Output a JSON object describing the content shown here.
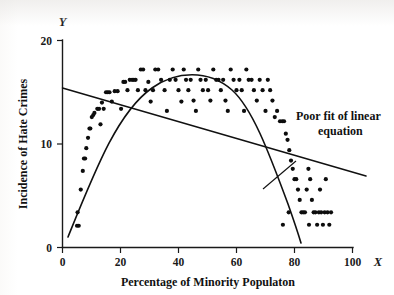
{
  "figure": {
    "background_color": "#ffffff",
    "ink_color": "#111111"
  },
  "chart_data": {
    "type": "scatter",
    "title": "",
    "xlabel": "Percentage of Minority Populaton",
    "ylabel": "Incidence of Hate Crimes",
    "x_axis_letter": "X",
    "y_axis_letter": "Y",
    "xlim": [
      0,
      100
    ],
    "ylim": [
      0,
      20
    ],
    "grid": false,
    "legend": null,
    "xticks": [
      0,
      20,
      40,
      60,
      80,
      100
    ],
    "xtick_labels": [
      "0",
      "20",
      "40",
      "60",
      "80",
      "100"
    ],
    "yticks": [
      0,
      10,
      20
    ],
    "ytick_labels": [
      "0",
      "10",
      "20"
    ],
    "points": [
      [
        5.0,
        2.1
      ],
      [
        5.6,
        2.1
      ],
      [
        5.2,
        3.4
      ],
      [
        6.3,
        5.6
      ],
      [
        7.0,
        7.4
      ],
      [
        7.4,
        8.6
      ],
      [
        7.8,
        8.6
      ],
      [
        8.2,
        9.6
      ],
      [
        8.8,
        10.6
      ],
      [
        9.3,
        11.5
      ],
      [
        9.6,
        11.5
      ],
      [
        10.1,
        12.6
      ],
      [
        10.6,
        12.8
      ],
      [
        11.0,
        13.0
      ],
      [
        12.0,
        13.4
      ],
      [
        12.6,
        13.4
      ],
      [
        13.1,
        11.9
      ],
      [
        13.6,
        14.0
      ],
      [
        14.2,
        13.4
      ],
      [
        15.0,
        15.0
      ],
      [
        15.6,
        15.0
      ],
      [
        16.2,
        15.0
      ],
      [
        17.0,
        14.1
      ],
      [
        18.0,
        15.1
      ],
      [
        19.0,
        15.1
      ],
      [
        20.2,
        13.4
      ],
      [
        21.0,
        16.0
      ],
      [
        21.6,
        16.0
      ],
      [
        22.4,
        15.2
      ],
      [
        23.2,
        16.2
      ],
      [
        24.0,
        16.2
      ],
      [
        24.6,
        16.2
      ],
      [
        25.2,
        16.2
      ],
      [
        26.0,
        15.2
      ],
      [
        27.0,
        17.2
      ],
      [
        27.8,
        17.2
      ],
      [
        28.6,
        15.2
      ],
      [
        29.6,
        16.0
      ],
      [
        30.4,
        14.1
      ],
      [
        31.2,
        15.2
      ],
      [
        32.0,
        17.2
      ],
      [
        33.0,
        17.2
      ],
      [
        34.0,
        16.2
      ],
      [
        35.2,
        15.2
      ],
      [
        36.0,
        13.2
      ],
      [
        37.0,
        16.2
      ],
      [
        38.0,
        17.2
      ],
      [
        39.0,
        16.2
      ],
      [
        40.0,
        15.2
      ],
      [
        41.0,
        14.1
      ],
      [
        41.8,
        17.2
      ],
      [
        42.6,
        16.2
      ],
      [
        43.4,
        15.2
      ],
      [
        44.2,
        16.2
      ],
      [
        45.2,
        14.2
      ],
      [
        46.0,
        13.2
      ],
      [
        46.8,
        17.2
      ],
      [
        47.6,
        16.2
      ],
      [
        48.4,
        15.2
      ],
      [
        49.4,
        16.2
      ],
      [
        50.2,
        15.2
      ],
      [
        51.0,
        14.2
      ],
      [
        52.0,
        17.2
      ],
      [
        53.0,
        16.2
      ],
      [
        53.8,
        16.2
      ],
      [
        54.6,
        15.2
      ],
      [
        55.4,
        16.2
      ],
      [
        56.2,
        14.2
      ],
      [
        57.0,
        13.2
      ],
      [
        58.0,
        17.2
      ],
      [
        59.0,
        16.2
      ],
      [
        60.0,
        15.2
      ],
      [
        61.0,
        16.2
      ],
      [
        61.8,
        15.2
      ],
      [
        62.6,
        13.2
      ],
      [
        63.4,
        17.2
      ],
      [
        64.2,
        16.2
      ],
      [
        65.2,
        16.2
      ],
      [
        66.0,
        15.2
      ],
      [
        67.0,
        14.2
      ],
      [
        68.0,
        16.2
      ],
      [
        69.0,
        15.2
      ],
      [
        70.0,
        13.2
      ],
      [
        70.8,
        16.2
      ],
      [
        71.6,
        15.2
      ],
      [
        72.4,
        14.2
      ],
      [
        73.2,
        12.6
      ],
      [
        74.0,
        13.2
      ],
      [
        75.0,
        12.2
      ],
      [
        75.8,
        12.2
      ],
      [
        76.4,
        12.2
      ],
      [
        77.0,
        11.0
      ],
      [
        77.6,
        10.4
      ],
      [
        78.2,
        9.4
      ],
      [
        78.8,
        8.4
      ],
      [
        79.4,
        7.6
      ],
      [
        80.0,
        6.6
      ],
      [
        80.6,
        6.6
      ],
      [
        81.2,
        5.6
      ],
      [
        81.8,
        4.6
      ],
      [
        82.4,
        3.4
      ],
      [
        83.0,
        3.4
      ],
      [
        83.6,
        3.4
      ],
      [
        84.2,
        5.6
      ],
      [
        84.8,
        7.6
      ],
      [
        85.4,
        6.6
      ],
      [
        86.0,
        4.6
      ],
      [
        86.6,
        3.4
      ],
      [
        87.2,
        3.4
      ],
      [
        87.8,
        2.2
      ],
      [
        88.4,
        3.4
      ],
      [
        88.8,
        5.6
      ],
      [
        89.2,
        3.4
      ],
      [
        89.8,
        2.2
      ],
      [
        90.4,
        3.4
      ],
      [
        90.8,
        6.6
      ],
      [
        91.4,
        3.4
      ],
      [
        92.0,
        2.2
      ],
      [
        92.6,
        3.4
      ],
      [
        78.0,
        3.4
      ],
      [
        76.0,
        2.2
      ],
      [
        85.0,
        2.2
      ]
    ],
    "fits": [
      {
        "name": "linear",
        "label": "Poor fit of linear equation",
        "shape": "straight",
        "intercept": 15.4,
        "slope": -0.082,
        "x_start": 0,
        "x_end": 103,
        "quality": "poor"
      },
      {
        "name": "quadratic",
        "label": "",
        "shape": "inverted-u",
        "vertex_x": 42,
        "vertex_y": 16.6,
        "x_start": 2,
        "x_end": 89,
        "quality": "good"
      }
    ],
    "annotations": [
      {
        "text_line_1": "Poor fit of linear",
        "text_line_2": "equation",
        "points_to": "linear-fit-line"
      }
    ]
  }
}
